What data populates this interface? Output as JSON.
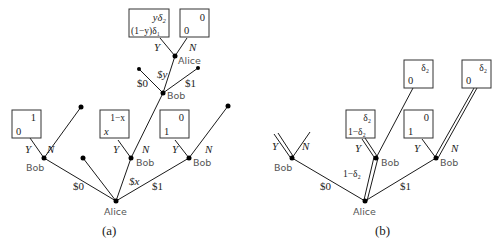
{
  "panel_a": {
    "caption": "(a)",
    "root_player": "Alice",
    "offers": {
      "zero": "$0",
      "x": "$x",
      "one": "$1"
    },
    "bob_label": "Bob",
    "yes": "Y",
    "no": "N",
    "payoff_bob0_yes": {
      "top": "1",
      "bottom": "0"
    },
    "payoff_bobx_yes": {
      "top": "1−x",
      "bottom": "x"
    },
    "payoff_bob1_yes": {
      "top": "0",
      "bottom": "1"
    },
    "counter": {
      "responder": "Bob",
      "offers": {
        "zero": "$0",
        "y": "$y",
        "one": "$1"
      },
      "alice_label": "Alice",
      "payoff_yes": {
        "top": "yδ₂",
        "bottom": "(1−y)δ₁"
      },
      "payoff_no": {
        "top": "0",
        "bottom": "0"
      }
    }
  },
  "panel_b": {
    "caption": "(b)",
    "root_player": "Alice",
    "offers": {
      "zero": "$0",
      "mid": "1−δ₂",
      "one": "$1"
    },
    "bob_label": "Bob",
    "yes": "Y",
    "no": "N",
    "payoff_mid_yes": {
      "top": "δ₂",
      "bottom": "1−δ₂"
    },
    "payoff_mid_no": {
      "top": "δ₂",
      "bottom": "0"
    },
    "payoff_one_yes": {
      "top": "0",
      "bottom": "1"
    },
    "payoff_one_no": {
      "top": "δ₂",
      "bottom": "0"
    }
  }
}
